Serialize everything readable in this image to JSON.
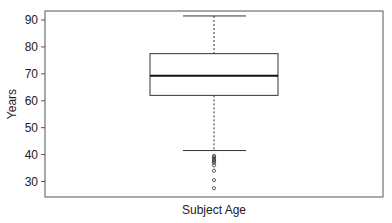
{
  "chart_data": {
    "type": "box",
    "title": "",
    "xlabel": "Subject Age",
    "ylabel": "Years",
    "ylim": [
      25.5,
      94
    ],
    "yticks": [
      30,
      40,
      50,
      60,
      70,
      80,
      90
    ],
    "grid": false,
    "legend": null,
    "categories": [
      "Subject Age"
    ],
    "series": [
      {
        "name": "Subject Age",
        "whisker_low": 41.5,
        "q1": 62,
        "median": 69.3,
        "q3": 77.5,
        "whisker_high": 91.5,
        "outliers": [
          39.5,
          39,
          38.5,
          38,
          37.5,
          37,
          36,
          34,
          30.5,
          27.5
        ]
      }
    ]
  },
  "colors": {
    "axis": "#555555",
    "box": "#333333",
    "median": "#111111",
    "background": "#ffffff"
  }
}
